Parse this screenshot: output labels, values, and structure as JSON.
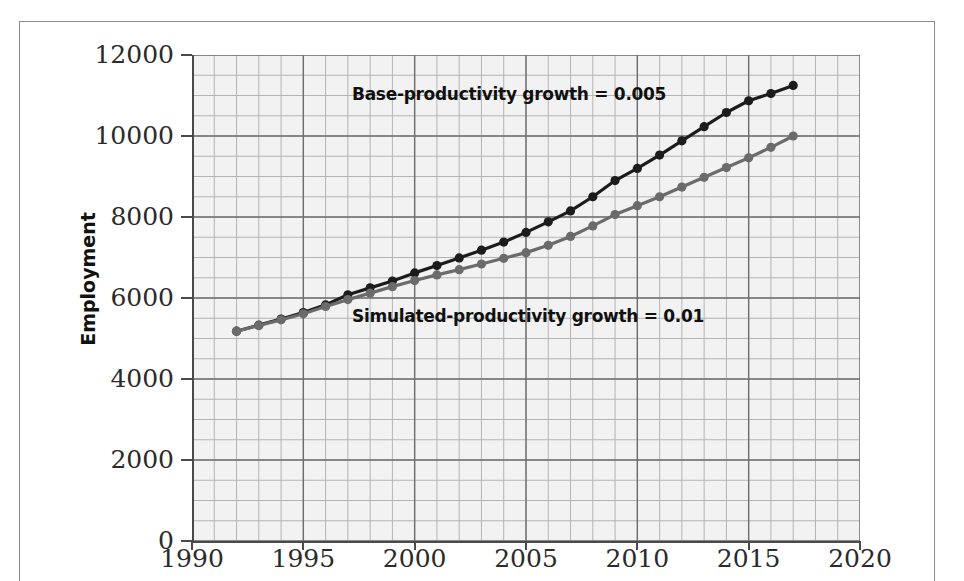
{
  "figure": {
    "name": "employment-productivity-growth-chart",
    "background": "#ffffff",
    "plot_background": "#f2f2f2"
  },
  "axis": {
    "y_title": "Employment",
    "y_ticks": [
      "0",
      "2000",
      "4000",
      "6000",
      "8000",
      "10000",
      "12000"
    ],
    "x_ticks": [
      "1990",
      "1995",
      "2000",
      "2005",
      "2010",
      "2015",
      "2020"
    ]
  },
  "annotations": {
    "base": "Base-productivity growth = 0.005",
    "simulated": "Simulated-productivity growth = 0.01"
  },
  "chart_data": {
    "type": "line",
    "title": "",
    "xlabel": "",
    "ylabel": "Employment",
    "xlim": [
      1990,
      2020
    ],
    "ylim": [
      0,
      12000
    ],
    "x_tick_step": 5,
    "y_tick_step": 2000,
    "x_minor_step": 1,
    "y_minor_step": 500,
    "grid": true,
    "grid_major_color": "#6e6e6e",
    "grid_minor_color": "#b4b4b4",
    "legend_position": "in-plot annotations",
    "markers": "filled-circle",
    "x": [
      1992,
      1993,
      1994,
      1995,
      1996,
      1997,
      1998,
      1999,
      2000,
      2001,
      2002,
      2003,
      2004,
      2005,
      2006,
      2007,
      2008,
      2009,
      2010,
      2011,
      2012,
      2013,
      2014,
      2015,
      2016,
      2017
    ],
    "series": [
      {
        "name": "Base-productivity growth = 0.005",
        "color": "#1c1c1c",
        "annotation": "Base-productivity growth = 0.005",
        "values": [
          5180,
          5330,
          5480,
          5640,
          5830,
          6080,
          6250,
          6420,
          6620,
          6800,
          6990,
          7180,
          7380,
          7620,
          7880,
          8150,
          8500,
          8900,
          9200,
          9530,
          9880,
          10230,
          10580,
          10870,
          11050,
          11250
        ]
      },
      {
        "name": "Simulated-productivity growth = 0.01",
        "color": "#6b6b6b",
        "annotation": "Simulated-productivity growth = 0.01",
        "values": [
          5180,
          5320,
          5460,
          5610,
          5790,
          5960,
          6120,
          6280,
          6430,
          6570,
          6700,
          6840,
          6980,
          7120,
          7300,
          7520,
          7780,
          8060,
          8280,
          8500,
          8740,
          8980,
          9220,
          9460,
          9720,
          10000
        ]
      }
    ]
  }
}
